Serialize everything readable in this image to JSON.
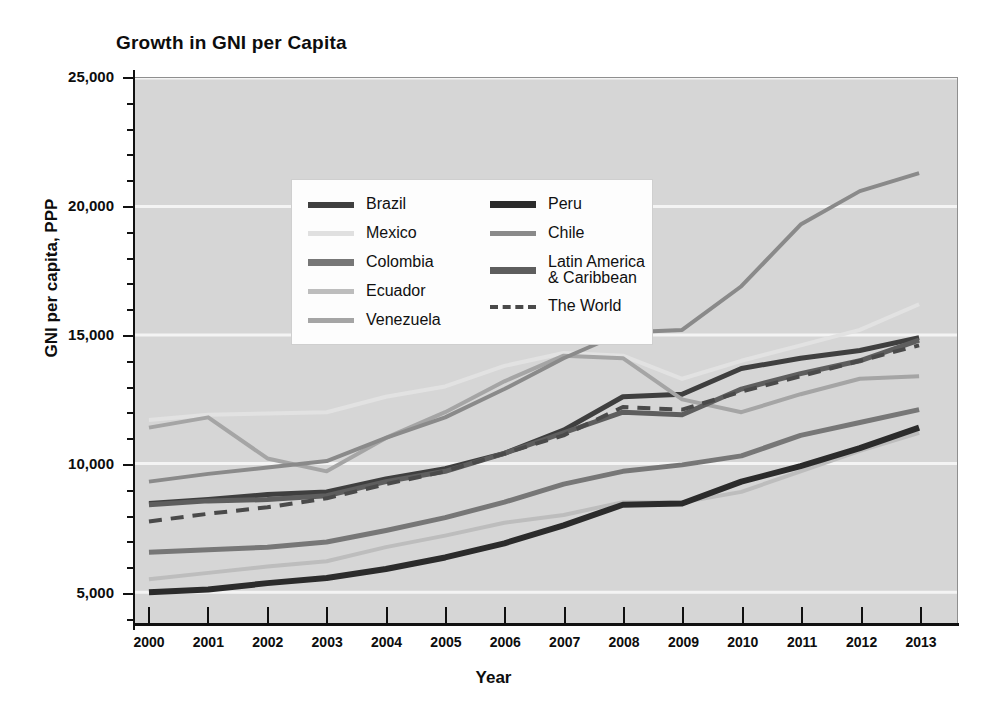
{
  "chart_data": {
    "type": "line",
    "title": "Growth in GNI per Capita",
    "xlabel": "Year",
    "ylabel": "GNI per capita, PPP",
    "x": [
      2000,
      2001,
      2002,
      2003,
      2004,
      2005,
      2006,
      2007,
      2008,
      2009,
      2010,
      2011,
      2012,
      2013
    ],
    "xlim": [
      2000,
      2013
    ],
    "ylim": [
      3800,
      25000
    ],
    "yticks": [
      5000,
      10000,
      15000,
      20000,
      25000
    ],
    "ytick_labels": [
      "5,000",
      "10,000",
      "15,000",
      "20,000",
      "25,000"
    ],
    "xtick_labels": [
      "2000",
      "2001",
      "2002",
      "2003",
      "2004",
      "2005",
      "2006",
      "2007",
      "2008",
      "2009",
      "2010",
      "2011",
      "2012",
      "2013"
    ],
    "y_minor_tick_step": 1000,
    "grid": "horizontal-major-white",
    "legend_position": "upper-left-inside",
    "plot_background": "#d6d6d6",
    "series": [
      {
        "name": "Brazil",
        "color": "#3f3f3f",
        "width": 5,
        "dash": false,
        "values": [
          8450,
          8600,
          8800,
          8900,
          9400,
          9800,
          10400,
          11300,
          12600,
          12700,
          13700,
          14100,
          14400,
          14900
        ]
      },
      {
        "name": "Mexico",
        "color": "#e2e2e2",
        "width": 4,
        "dash": false,
        "values": [
          11700,
          11900,
          11950,
          12000,
          12600,
          13000,
          13800,
          14300,
          14200,
          13300,
          14000,
          14600,
          15200,
          16200
        ]
      },
      {
        "name": "Colombia",
        "color": "#777777",
        "width": 5,
        "dash": false,
        "values": [
          6550,
          6650,
          6750,
          6950,
          7400,
          7900,
          8500,
          9200,
          9700,
          9950,
          10300,
          11100,
          11600,
          12100
        ]
      },
      {
        "name": "Ecuador",
        "color": "#bdbdbd",
        "width": 4,
        "dash": false,
        "values": [
          5500,
          5750,
          6000,
          6200,
          6750,
          7200,
          7700,
          8000,
          8500,
          8500,
          8900,
          9700,
          10500,
          11200
        ]
      },
      {
        "name": "Venezuela",
        "color": "#a5a5a5",
        "width": 4,
        "dash": false,
        "values": [
          11400,
          11800,
          10200,
          9700,
          11000,
          12000,
          13200,
          14200,
          14100,
          12500,
          12000,
          12700,
          13300,
          13400
        ]
      },
      {
        "name": "Peru",
        "color": "#2b2b2b",
        "width": 6,
        "dash": false,
        "values": [
          5000,
          5100,
          5350,
          5550,
          5900,
          6350,
          6900,
          7600,
          8400,
          8450,
          9300,
          9900,
          10600,
          11400
        ]
      },
      {
        "name": "Chile",
        "color": "#8a8a8a",
        "width": 4,
        "dash": false,
        "values": [
          9300,
          9600,
          9850,
          10100,
          11000,
          11800,
          12900,
          14100,
          15100,
          15200,
          16900,
          19300,
          20600,
          21300
        ]
      },
      {
        "name": "Latin America & Caribbean",
        "color": "#5e5e5e",
        "width": 5,
        "dash": false,
        "values": [
          8400,
          8550,
          8600,
          8750,
          9300,
          9700,
          10400,
          11200,
          12000,
          11900,
          12900,
          13500,
          14000,
          14800
        ]
      },
      {
        "name": "The World",
        "color": "#4a4a4a",
        "width": 4,
        "dash": true,
        "values": [
          7750,
          8050,
          8300,
          8650,
          9200,
          9700,
          10400,
          11100,
          12200,
          12100,
          12800,
          13400,
          14000,
          14600
        ]
      }
    ]
  },
  "legend": {
    "left_column": [
      {
        "label": "Brazil",
        "swatch_color": "#3f3f3f",
        "swatch_height": 6,
        "dashed": false
      },
      {
        "label": "Mexico",
        "swatch_color": "#e0e0e0",
        "swatch_height": 5,
        "dashed": false
      },
      {
        "label": "Colombia",
        "swatch_color": "#777777",
        "swatch_height": 7,
        "dashed": false
      },
      {
        "label": "Ecuador",
        "swatch_color": "#bdbdbd",
        "swatch_height": 5,
        "dashed": false
      },
      {
        "label": "Venezuela",
        "swatch_color": "#a5a5a5",
        "swatch_height": 5,
        "dashed": false
      }
    ],
    "right_column": [
      {
        "label": "Peru",
        "swatch_color": "#2b2b2b",
        "swatch_height": 7,
        "dashed": false
      },
      {
        "label": "Chile",
        "swatch_color": "#8a8a8a",
        "swatch_height": 5,
        "dashed": false
      },
      {
        "label": "Latin America\n& Caribbean",
        "swatch_color": "#5e5e5e",
        "swatch_height": 7,
        "dashed": false
      },
      {
        "label": "The World",
        "swatch_color": "#4a4a4a",
        "swatch_height": 0,
        "dashed": true
      }
    ]
  }
}
